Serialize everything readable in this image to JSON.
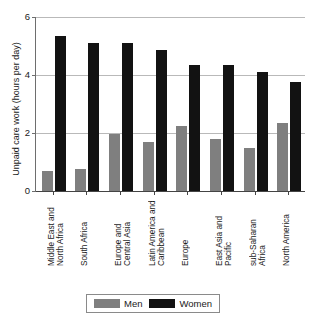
{
  "chart_data": {
    "type": "bar",
    "title": "",
    "xlabel": "",
    "ylabel": "Unpaid care work (hours per day)",
    "ylim": [
      0,
      6
    ],
    "yticks": [
      0,
      2,
      4,
      6
    ],
    "ytick_labels": [
      "0",
      "2",
      "4",
      "6"
    ],
    "grid": true,
    "legend_position": "bottom",
    "categories": [
      "Middle East and\nNorth Africa",
      "South Africa",
      "Europe and\nCentral Asia",
      "Latin America and\nCaribbean",
      "Europe",
      "East Asia and\nPacific",
      "sub-Saharan\nAfrica",
      "North America"
    ],
    "series": [
      {
        "name": "Men",
        "color": "#7f7f7f",
        "values": [
          0.7,
          0.75,
          1.95,
          1.7,
          2.25,
          1.8,
          1.5,
          2.35
        ]
      },
      {
        "name": "Women",
        "color": "#121212",
        "values": [
          5.35,
          5.1,
          5.1,
          4.85,
          4.35,
          4.35,
          4.1,
          3.75
        ]
      }
    ]
  },
  "legend": {
    "items": [
      {
        "label": "Men",
        "color": "#7f7f7f"
      },
      {
        "label": "Women",
        "color": "#121212"
      }
    ]
  }
}
